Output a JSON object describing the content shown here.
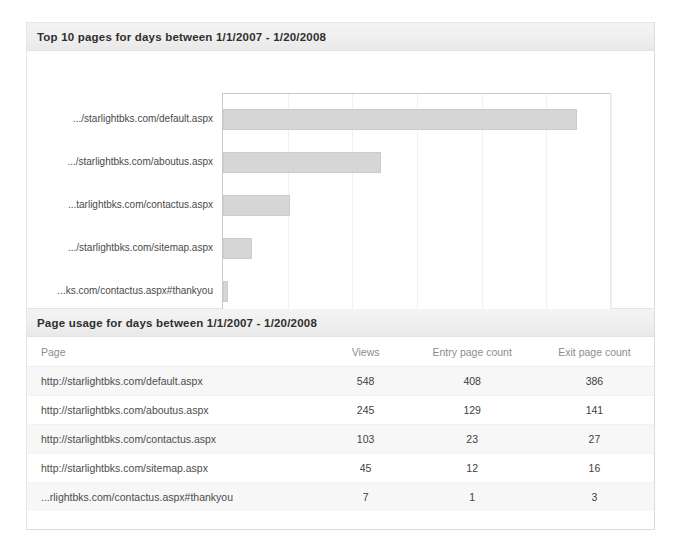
{
  "chart_section": {
    "header_title": "Top 10 pages for days between 1/1/2007 - 1/20/2008"
  },
  "table_section": {
    "header_title": "Page usage for days between 1/1/2007 - 1/20/2008",
    "columns": [
      "Page",
      "Views",
      "Entry page count",
      "Exit page count"
    ],
    "rows": [
      {
        "page": "http://starlightbks.com/default.aspx",
        "views": "548",
        "entry": "408",
        "exit": "386"
      },
      {
        "page": "http://starlightbks.com/aboutus.aspx",
        "views": "245",
        "entry": "129",
        "exit": "141"
      },
      {
        "page": "http://starlightbks.com/contactus.aspx",
        "views": "103",
        "entry": "23",
        "exit": "27"
      },
      {
        "page": "http://starlightbks.com/sitemap.aspx",
        "views": "45",
        "entry": "12",
        "exit": "16"
      },
      {
        "page": "...rlightbks.com/contactus.aspx#thankyou",
        "views": "7",
        "entry": "1",
        "exit": "3"
      }
    ]
  },
  "chart_data": {
    "type": "bar",
    "orientation": "horizontal",
    "title": "Top 10 pages for days between 1/1/2007 - 1/20/2008",
    "xlabel": "",
    "ylabel": "",
    "categories": [
      ".../starlightbks.com/default.aspx",
      ".../starlightbks.com/aboutus.aspx",
      "...tarlightbks.com/contactus.aspx",
      ".../starlightbks.com/sitemap.aspx",
      "...ks.com/contactus.aspx#thankyou"
    ],
    "values": [
      548,
      245,
      103,
      45,
      7
    ],
    "xlim": [
      0,
      600
    ],
    "xticks": [
      0,
      100,
      200,
      300,
      400,
      500,
      600
    ],
    "grid": true,
    "legend": false,
    "bar_color": "#d6d6d6",
    "bar_border_color": "#cccccc"
  }
}
